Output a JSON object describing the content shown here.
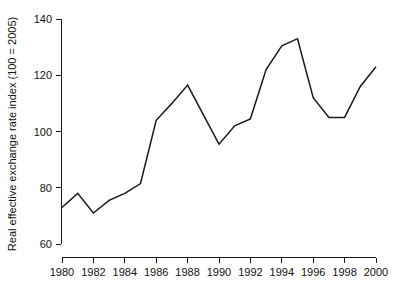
{
  "chart_data": {
    "type": "line",
    "title": "",
    "subtitle": "",
    "xlabel": "",
    "ylabel": "Real effective exchange rate index (100 = 2005)",
    "x": [
      1980,
      1981,
      1982,
      1983,
      1984,
      1985,
      1986,
      1987,
      1988,
      1989,
      1990,
      1991,
      1992,
      1993,
      1994,
      1995,
      1996,
      1997,
      1998,
      1999,
      2000
    ],
    "values": [
      73,
      78,
      71,
      75.5,
      78,
      81.5,
      104,
      110,
      116.5,
      106,
      95.5,
      102,
      104.5,
      122,
      130.5,
      133,
      112,
      105,
      105,
      116,
      123
    ],
    "series": [
      {
        "name": "Real effective exchange rate index",
        "values": [
          73,
          78,
          71,
          75.5,
          78,
          81.5,
          104,
          110,
          116.5,
          106,
          95.5,
          102,
          104.5,
          122,
          130.5,
          133,
          112,
          105,
          105,
          116,
          123
        ]
      }
    ],
    "xlim": [
      1979.4,
      2000.6
    ],
    "ylim": [
      58,
      142
    ],
    "xticks": [
      1980,
      1982,
      1984,
      1986,
      1988,
      1990,
      1992,
      1994,
      1996,
      1998,
      2000
    ],
    "xtick_labels": [
      "1980",
      "1982",
      "1984",
      "1986",
      "1988",
      "1990",
      "1992",
      "1994",
      "1996",
      "1998",
      "2000"
    ],
    "yticks": [
      60,
      80,
      100,
      120,
      140
    ],
    "ytick_labels": [
      "60",
      "80",
      "100",
      "120",
      "140"
    ],
    "grid": false,
    "legend": false,
    "legend_position": "none",
    "line_color": "#1a1a1a",
    "axis_color": "#1a1a1a",
    "background_color": "#ffffff"
  }
}
